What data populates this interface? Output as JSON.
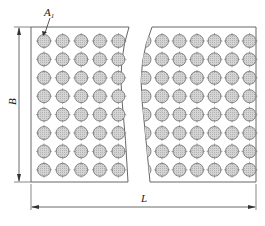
{
  "diagram": {
    "type": "perforated plate with dimensions",
    "labels": {
      "hole_label": "A",
      "hole_label_sub": "1",
      "height_label": "B",
      "length_label": "L"
    },
    "grid": {
      "rows": 8,
      "left_columns": 5,
      "right_columns": 6,
      "break": "wavy break lines between left and right sections"
    },
    "colors": {
      "line": "#555555",
      "hole_fill": "#c8c8c8",
      "hole_stroke": "#707070"
    }
  }
}
